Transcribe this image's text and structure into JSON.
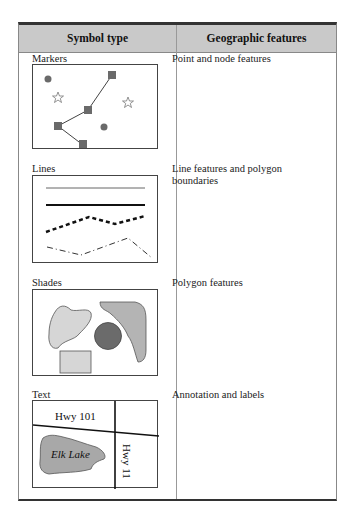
{
  "table": {
    "headers": {
      "symbol_type": "Symbol type",
      "geographic_features": "Geographic features"
    },
    "rows": [
      {
        "symbol": "Markers",
        "feature": "Point and node features"
      },
      {
        "symbol": "Lines",
        "feature": "Line features and polygon boundaries"
      },
      {
        "symbol": "Shades",
        "feature": "Polygon features"
      },
      {
        "symbol": "Text",
        "feature": "Annotation and labels"
      }
    ]
  },
  "text_example": {
    "road_horizontal": "Hwy 101",
    "road_vertical": "Hwy 11",
    "lake": "Elk Lake"
  },
  "colors": {
    "header_bg": "#c9c9c9",
    "marker_fill": "#6a6a6a",
    "shade_light": "#d6d6d6",
    "shade_medium": "#b4b4b4",
    "shade_dark": "#6b6b6b",
    "lake_fill": "#a8a8a8"
  }
}
